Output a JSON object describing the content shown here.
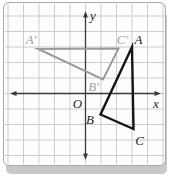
{
  "figure": {
    "kind": "coordinate-plane-rotation-diagram",
    "unit_px": 15.5,
    "origin_px": {
      "x": 85.5,
      "y": 93.5
    },
    "panel": {
      "background": "#fdfdfd",
      "border_color": "#a9a9a9",
      "shadow_color": "#c8c8c8"
    },
    "grid": {
      "color": "#c9ccd0",
      "cell_px": 15.5,
      "first_x": 8,
      "cols": 11,
      "first_y": 16,
      "rows": 10,
      "top": 4,
      "bottom": 164,
      "left": 5,
      "right": 164.5
    },
    "axes": {
      "color": "#3a3a3a",
      "origin_label": "O",
      "x": {
        "label": "x",
        "y_px": 93.5,
        "tip1": 10,
        "tip2": 161
      },
      "y": {
        "label": "y",
        "x_px": 85.5,
        "tip1": 11,
        "tip2": 160
      }
    },
    "triangles": [
      {
        "id": "triangle-abc",
        "role": "preimage",
        "color": "#151515",
        "stroke_width": 2.4,
        "vertices": [
          {
            "label": "A",
            "x": 3,
            "y": 3,
            "nudge_px": [
              0,
              0
            ]
          },
          {
            "label": "B",
            "x": 1,
            "y": -1,
            "nudge_px": [
              -0.5,
              5.5
            ]
          },
          {
            "label": "C",
            "x": 3,
            "y": -2,
            "nudge_px": [
              1.5,
              4.5
            ]
          }
        ]
      },
      {
        "id": "triangle-a-prime-b-prime-c-prime",
        "role": "rotated-image",
        "color": "#9b9b9b",
        "stroke_width": 2,
        "vertices": [
          {
            "label": "A'",
            "x": -3,
            "y": 3,
            "nudge_px": [
              -0.7,
              2
            ]
          },
          {
            "label": "B'",
            "x": 1,
            "y": 1,
            "nudge_px": [
              2,
              1.5
            ]
          },
          {
            "label": "C'",
            "x": 2,
            "y": 3,
            "nudge_px": [
              2,
              1.5
            ]
          }
        ]
      }
    ]
  }
}
